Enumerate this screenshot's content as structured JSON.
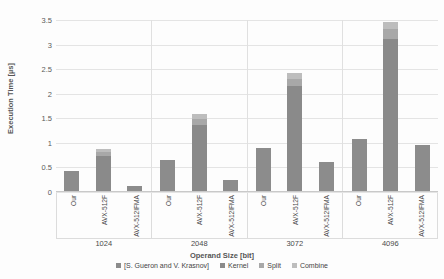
{
  "chart_data": {
    "type": "bar",
    "title": "",
    "xlabel": "Operand Size [bit]",
    "ylabel": "Execution Time [µs]",
    "ylim": [
      0,
      3.5
    ],
    "ytick_values": [
      0,
      0.5,
      1,
      1.5,
      2,
      2.5,
      3,
      3.5
    ],
    "ytick_labels": [
      "0",
      "0.5",
      "1",
      "1.5",
      "2",
      "2.5",
      "3",
      "3.5"
    ],
    "grid": true,
    "stacked": true,
    "legend_position": "bottom",
    "legend": [
      "[S. Gueron and V. Krasnov]",
      "Kernel",
      "Split",
      "Combine"
    ],
    "group_categories": [
      "1024",
      "2048",
      "3072",
      "4096"
    ],
    "bar_categories": [
      "Our",
      "AVX-512F",
      "AVX-512IFMA"
    ],
    "groups": [
      {
        "category": "1024",
        "bars": [
          {
            "label": "Our",
            "total": 0.42,
            "segments": [
              {
                "name": "[S. Gueron and V. Krasnov]",
                "value": 0.42
              }
            ]
          },
          {
            "label": "AVX-512F",
            "total": 0.88,
            "segments": [
              {
                "name": "Kernel",
                "value": 0.73
              },
              {
                "name": "Split",
                "value": 0.09
              },
              {
                "name": "Combine",
                "value": 0.06
              }
            ]
          },
          {
            "label": "AVX-512IFMA",
            "total": 0.13,
            "segments": [
              {
                "name": "[S. Gueron and V. Krasnov]",
                "value": 0.13
              }
            ]
          }
        ]
      },
      {
        "category": "2048",
        "bars": [
          {
            "label": "Our",
            "total": 0.65,
            "segments": [
              {
                "name": "[S. Gueron and V. Krasnov]",
                "value": 0.65
              }
            ]
          },
          {
            "label": "AVX-512F",
            "total": 1.58,
            "segments": [
              {
                "name": "Kernel",
                "value": 1.37
              },
              {
                "name": "Split",
                "value": 0.12
              },
              {
                "name": "Combine",
                "value": 0.09
              }
            ]
          },
          {
            "label": "AVX-512IFMA",
            "total": 0.25,
            "segments": [
              {
                "name": "[S. Gueron and V. Krasnov]",
                "value": 0.25
              }
            ]
          }
        ]
      },
      {
        "category": "3072",
        "bars": [
          {
            "label": "Our",
            "total": 0.9,
            "segments": [
              {
                "name": "[S. Gueron and V. Krasnov]",
                "value": 0.9
              }
            ]
          },
          {
            "label": "AVX-512F",
            "total": 2.42,
            "segments": [
              {
                "name": "Kernel",
                "value": 2.16
              },
              {
                "name": "Split",
                "value": 0.15
              },
              {
                "name": "Combine",
                "value": 0.11
              }
            ]
          },
          {
            "label": "AVX-512IFMA",
            "total": 0.62,
            "segments": [
              {
                "name": "[S. Gueron and V. Krasnov]",
                "value": 0.62
              }
            ]
          }
        ]
      },
      {
        "category": "4096",
        "bars": [
          {
            "label": "Our",
            "total": 1.08,
            "segments": [
              {
                "name": "[S. Gueron and V. Krasnov]",
                "value": 1.08
              }
            ]
          },
          {
            "label": "AVX-512F",
            "total": 3.45,
            "segments": [
              {
                "name": "Kernel",
                "value": 3.12
              },
              {
                "name": "Split",
                "value": 0.19
              },
              {
                "name": "Combine",
                "value": 0.14
              }
            ]
          },
          {
            "label": "AVX-512IFMA",
            "total": 0.95,
            "segments": [
              {
                "name": "[S. Gueron and V. Krasnov]",
                "value": 0.95
              }
            ]
          }
        ]
      }
    ]
  },
  "colors": {
    "base": "#8c8c8c",
    "kernel": "#8a8a8a",
    "split": "#a8a8a8",
    "combine": "#bdbdbd",
    "grid": "#e4e4e4",
    "text": "#4a4a4a"
  }
}
